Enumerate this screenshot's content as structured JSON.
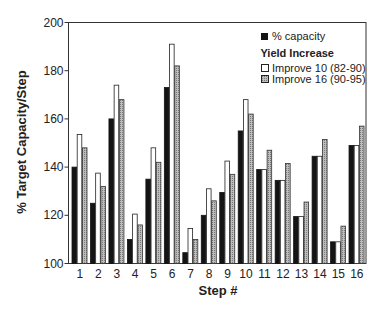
{
  "chart_data": {
    "type": "bar",
    "title": "",
    "xlabel": "Step #",
    "ylabel": "% Target Capacity/Step",
    "ylim": [
      100,
      200
    ],
    "yticks": [
      100,
      120,
      140,
      160,
      180,
      200
    ],
    "grid": false,
    "legend_position": "upper right",
    "categories": [
      "1",
      "2",
      "3",
      "4",
      "5",
      "6",
      "7",
      "8",
      "9",
      "10",
      "11",
      "12",
      "13",
      "14",
      "15",
      "16"
    ],
    "series": [
      {
        "name": "% capacity",
        "style": "black",
        "values": [
          140,
          125,
          160,
          110,
          135,
          173,
          104.5,
          120,
          129.5,
          155,
          139,
          134.5,
          119.5,
          144.5,
          109,
          149
        ]
      },
      {
        "name": "Improve 10 (82-90)",
        "style": "white",
        "values": [
          153.5,
          137.5,
          174,
          120.5,
          148,
          191,
          114.5,
          131,
          142.5,
          168,
          139,
          134.5,
          119.5,
          144.5,
          109,
          149
        ]
      },
      {
        "name": "Improve 16 (90-95)",
        "style": "gray",
        "values": [
          148,
          132,
          168,
          116,
          142,
          182,
          110,
          126,
          137,
          162,
          147,
          141.5,
          125.5,
          151.5,
          115.5,
          157
        ]
      }
    ],
    "legend": {
      "entries": [
        {
          "label": "% capacity",
          "style": "black"
        },
        {
          "header": "Yield Increase"
        },
        {
          "label": "Improve 10 (82-90)",
          "style": "white"
        },
        {
          "label": "Improve 16 (90-95)",
          "style": "gray"
        }
      ]
    }
  },
  "labels": {
    "ylabel": "% Target Capacity/Step",
    "xlabel": "Step #",
    "legend_capacity": "% capacity",
    "legend_header": "Yield Increase",
    "legend_improve10": "Improve 10 (82-90)",
    "legend_improve16": "Improve 16 (90-95)"
  },
  "colors": {
    "black": "#141414",
    "white": "#ffffff",
    "gray": "#a8a8a8",
    "axis": "#333333"
  }
}
